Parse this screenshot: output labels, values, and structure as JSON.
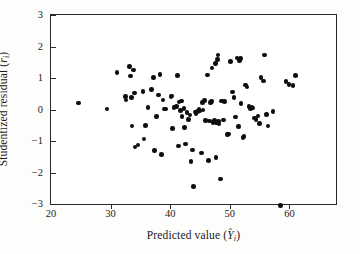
{
  "figure": {
    "kind": "scatter-plot",
    "background": "#ffffff",
    "point_color": "#0d0d0d",
    "frame_color": "#2a2a2a"
  },
  "axes": {
    "x": {
      "title_text": "Predicted value (Ŷi)",
      "title_prefix": "Predicted value (",
      "title_var": "Y",
      "title_sub": "i",
      "title_suffix": ")",
      "ticks": [
        20,
        30,
        40,
        50,
        60
      ],
      "tick_labels": [
        "20",
        "30",
        "40",
        "50",
        "60"
      ],
      "range": [
        20,
        67.8
      ]
    },
    "y": {
      "title_text": "Studentized residual (ri)",
      "title_prefix": "Studentized residual (",
      "title_var": "r",
      "title_sub": "i",
      "title_suffix": ")",
      "ticks": [
        3,
        2,
        1,
        0,
        -1,
        -2,
        -3
      ],
      "tick_labels": [
        "3",
        "2",
        "1",
        "0",
        "−1",
        "−2",
        "−3"
      ],
      "range": [
        -3,
        3
      ]
    }
  },
  "chart_data": {
    "type": "scatter",
    "title": "",
    "xlabel": "Predicted value (Yi)",
    "ylabel": "Studentized residual (ri)",
    "xlim": [
      20,
      67.8
    ],
    "ylim": [
      -3,
      3
    ],
    "grid": false,
    "legend": false,
    "n_points": 105,
    "marker": "filled-circle",
    "points": [
      [
        24.6,
        0.21
      ],
      [
        29.4,
        0.02
      ],
      [
        31.1,
        1.18
      ],
      [
        32.5,
        0.42
      ],
      [
        32.6,
        0.3
      ],
      [
        33.2,
        1.36
      ],
      [
        33.3,
        1.06
      ],
      [
        33.5,
        0.38
      ],
      [
        33.6,
        -0.53
      ],
      [
        33.8,
        1.26
      ],
      [
        34.0,
        0.53
      ],
      [
        34.1,
        -1.19
      ],
      [
        34.6,
        -1.13
      ],
      [
        35.4,
        0.58
      ],
      [
        35.6,
        -0.93
      ],
      [
        35.8,
        -0.51
      ],
      [
        36.3,
        0.07
      ],
      [
        36.9,
        0.64
      ],
      [
        37.2,
        1.02
      ],
      [
        37.4,
        -1.31
      ],
      [
        37.7,
        -0.22
      ],
      [
        38.0,
        0.46
      ],
      [
        38.3,
        1.12
      ],
      [
        38.5,
        -1.42
      ],
      [
        38.8,
        0.3
      ],
      [
        39.0,
        0.02
      ],
      [
        39.3,
        0.01
      ],
      [
        40.1,
        0.41
      ],
      [
        40.3,
        0.43
      ],
      [
        40.4,
        -0.61
      ],
      [
        40.6,
        0.06
      ],
      [
        41.0,
        0.09
      ],
      [
        41.2,
        1.07
      ],
      [
        41.4,
        -1.16
      ],
      [
        41.5,
        0.24
      ],
      [
        41.7,
        -0.04
      ],
      [
        41.9,
        0.27
      ],
      [
        42.0,
        -0.22
      ],
      [
        42.3,
        0.03
      ],
      [
        42.4,
        -0.57
      ],
      [
        42.6,
        -1.09
      ],
      [
        42.8,
        -0.09
      ],
      [
        43.1,
        -0.31
      ],
      [
        43.3,
        -0.17
      ],
      [
        43.5,
        -1.66
      ],
      [
        43.7,
        -1.28
      ],
      [
        43.9,
        -2.45
      ],
      [
        44.2,
        -0.08
      ],
      [
        44.3,
        -0.14
      ],
      [
        44.6,
        -0.06
      ],
      [
        44.8,
        0.02
      ],
      [
        45.0,
        -0.05
      ],
      [
        45.2,
        -1.38
      ],
      [
        45.4,
        0.23
      ],
      [
        45.5,
        -0.02
      ],
      [
        45.7,
        0.28
      ],
      [
        45.9,
        -0.35
      ],
      [
        46.2,
        1.09
      ],
      [
        46.4,
        -1.62
      ],
      [
        46.6,
        -0.37
      ],
      [
        46.8,
        0.22
      ],
      [
        46.9,
        0.25
      ],
      [
        47.0,
        1.32
      ],
      [
        47.2,
        -0.41
      ],
      [
        47.4,
        -0.34
      ],
      [
        47.6,
        1.46
      ],
      [
        47.7,
        -1.52
      ],
      [
        47.8,
        -0.43
      ],
      [
        47.9,
        1.58
      ],
      [
        48.0,
        1.73
      ],
      [
        48.1,
        -0.39
      ],
      [
        48.2,
        -0.46
      ],
      [
        48.4,
        -2.2
      ],
      [
        48.6,
        0.27
      ],
      [
        48.9,
        -0.33
      ],
      [
        49.1,
        0.26
      ],
      [
        49.6,
        -0.79
      ],
      [
        49.8,
        -0.78
      ],
      [
        50.1,
        1.52
      ],
      [
        50.4,
        0.56
      ],
      [
        50.7,
        0.39
      ],
      [
        50.9,
        -0.24
      ],
      [
        51.2,
        1.63
      ],
      [
        51.4,
        -0.54
      ],
      [
        51.6,
        1.55
      ],
      [
        51.8,
        1.62
      ],
      [
        51.9,
        0.19
      ],
      [
        52.2,
        -0.88
      ],
      [
        52.4,
        -0.86
      ],
      [
        52.6,
        0.78
      ],
      [
        52.9,
        0.72
      ],
      [
        53.2,
        0.09
      ],
      [
        53.5,
        0.04
      ],
      [
        53.7,
        0.07
      ],
      [
        53.9,
        0.05
      ],
      [
        54.1,
        -0.27
      ],
      [
        54.4,
        -0.31
      ],
      [
        54.7,
        -0.21
      ],
      [
        55.0,
        -0.44
      ],
      [
        55.2,
        1.01
      ],
      [
        55.6,
        0.9
      ],
      [
        55.8,
        1.73
      ],
      [
        56.1,
        -0.16
      ],
      [
        56.4,
        -0.53
      ],
      [
        57.2,
        -0.07
      ],
      [
        58.5,
        -3.05
      ],
      [
        59.4,
        0.88
      ],
      [
        59.9,
        0.79
      ],
      [
        60.6,
        0.77
      ],
      [
        61.0,
        1.08
      ]
    ]
  }
}
